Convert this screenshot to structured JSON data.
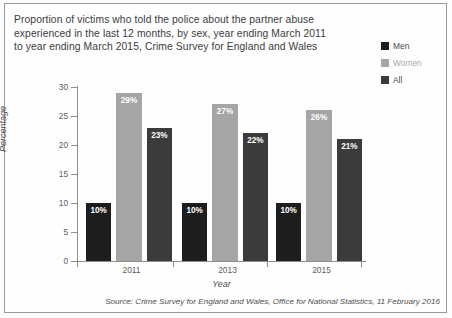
{
  "title_lines": [
    "Proportion of victims who told the police about the partner abuse",
    "experienced in the last 12 months, by sex, year ending March 2011",
    "to year ending March 2015, Crime Survey for England and Wales"
  ],
  "source_note": "Source: Crime Survey for England and Wales, Office for National Statistics, 11 February 2016",
  "colors": {
    "men": "#1d1d1d",
    "women": "#a5a5a5",
    "all": "#3b3b3b",
    "axis": "#8d8d8d",
    "text": "#4b4b4b",
    "frame": "#9a9a9a"
  },
  "chart_data": {
    "type": "bar",
    "xlabel": "Year",
    "ylabel": "Percentage",
    "ylim": [
      0,
      30
    ],
    "yticks": [
      0,
      5,
      10,
      15,
      20,
      25,
      30
    ],
    "ytick_labels": [
      "0",
      "5",
      "10",
      "15",
      "20",
      "25",
      "30"
    ],
    "grid": false,
    "legend_position": "top-right",
    "categories": [
      "2011",
      "2013",
      "2015"
    ],
    "series": [
      {
        "name": "Men",
        "values": [
          10,
          10,
          10
        ],
        "labels": [
          "10%",
          "10%",
          "10%"
        ],
        "color": "#1d1d1d"
      },
      {
        "name": "Women",
        "values": [
          29,
          27,
          26
        ],
        "labels": [
          "29%",
          "27%",
          "26%"
        ],
        "color": "#a5a5a5"
      },
      {
        "name": "All",
        "values": [
          23,
          22,
          21
        ],
        "labels": [
          "23%",
          "22%",
          "21%"
        ],
        "color": "#3b3b3b"
      }
    ]
  }
}
